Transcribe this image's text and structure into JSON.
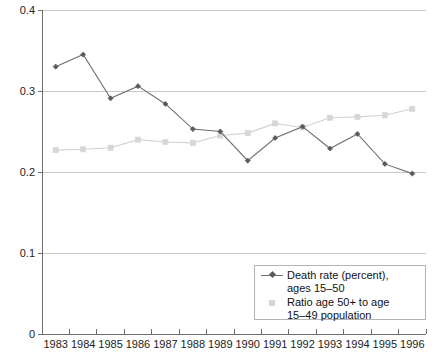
{
  "chart_data": {
    "type": "line",
    "title": "",
    "subtitle": "",
    "xlabel": "",
    "ylabel": "",
    "categories": [
      "1983",
      "1984",
      "1985",
      "1986",
      "1987",
      "1988",
      "1989",
      "1990",
      "1991",
      "1992",
      "1993",
      "1994",
      "1995",
      "1996"
    ],
    "ylim": [
      0,
      0.4
    ],
    "yticks": [
      "0",
      "0.1",
      "0.2",
      "0.3",
      "0.4"
    ],
    "ytick_values": [
      0,
      0.1,
      0.2,
      0.3,
      0.4
    ],
    "grid": true,
    "legend_position": "bottom-right",
    "series": [
      {
        "name": "Death rate (percent), ages 15–50",
        "marker": "diamond",
        "color": "#6f6f6f",
        "values": [
          0.33,
          0.345,
          0.291,
          0.306,
          0.284,
          0.253,
          0.25,
          0.214,
          0.242,
          0.256,
          0.229,
          0.247,
          0.21,
          0.198
        ]
      },
      {
        "name": "Ratio age 50+ to age 15–49 population",
        "marker": "square",
        "color": "#d6d6d6",
        "values": [
          0.227,
          0.228,
          0.23,
          0.24,
          0.237,
          0.236,
          0.245,
          0.248,
          0.26,
          0.255,
          0.267,
          0.268,
          0.27,
          0.278
        ]
      }
    ]
  },
  "legend": {
    "entries": [
      {
        "label": "Death rate (percent),\nages 15–50",
        "key": "diamond-line-marker"
      },
      {
        "label": "Ratio age 50+ to age\n15–49 population",
        "key": "square-marker"
      }
    ]
  },
  "axes": {
    "y_tick_labels": [
      "0.4",
      "0.3",
      "0.2",
      "0.1",
      "0"
    ],
    "x_tick_labels": [
      "1983",
      "1984",
      "1985",
      "1986",
      "1987",
      "1988",
      "1989",
      "1990",
      "1991",
      "1992",
      "1993",
      "1994",
      "1995",
      "1996"
    ]
  },
  "colors": {
    "series1": "#6f6f6f",
    "series2": "#d6d6d6",
    "grid": "#c8c8c8",
    "axis": "#6e6e6e",
    "text": "#1a1a1a",
    "background": "#ffffff"
  }
}
